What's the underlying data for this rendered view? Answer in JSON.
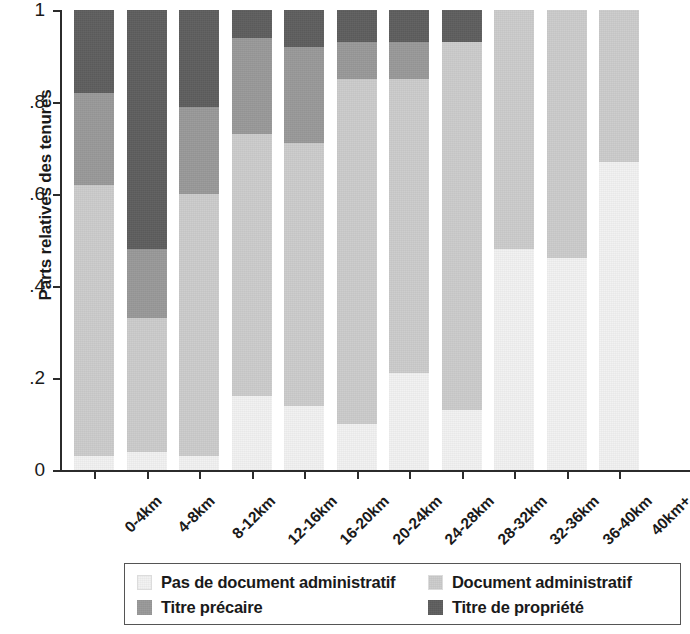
{
  "chart_data": {
    "type": "bar",
    "subtype": "stacked-100-percent",
    "title": "",
    "xlabel": "",
    "ylabel": "Parts relatives des tenures",
    "ylim": [
      0,
      1
    ],
    "ytick_labels": [
      "0",
      ".2",
      ".4",
      ".6",
      ".8",
      "1"
    ],
    "ytick_values": [
      0,
      0.2,
      0.4,
      0.6,
      0.8,
      1
    ],
    "grid": false,
    "legend_position": "bottom",
    "categories": [
      "0-4km",
      "4-8km",
      "8-12km",
      "12-16km",
      "16-20km",
      "20-24km",
      "24-28km",
      "28-32km",
      "32-36km",
      "36-40km",
      "40km+"
    ],
    "series": [
      {
        "name": "Pas de document administratif",
        "color": "#f2f2f2",
        "values": [
          0.03,
          0.04,
          0.03,
          0.16,
          0.14,
          0.1,
          0.21,
          0.13,
          0.48,
          0.46,
          0.67
        ]
      },
      {
        "name": "Document administratif",
        "color": "#cccccc",
        "values": [
          0.59,
          0.29,
          0.57,
          0.57,
          0.57,
          0.75,
          0.64,
          0.8,
          0.52,
          0.54,
          0.33
        ]
      },
      {
        "name": "Titre précaire",
        "color": "#999999",
        "values": [
          0.2,
          0.15,
          0.19,
          0.21,
          0.21,
          0.08,
          0.08,
          0.0,
          0.0,
          0.0,
          0.0
        ]
      },
      {
        "name": "Titre de propriété",
        "color": "#5e5e5e",
        "values": [
          0.18,
          0.52,
          0.21,
          0.06,
          0.08,
          0.07,
          0.07,
          0.07,
          0.0,
          0.0,
          0.0
        ]
      }
    ],
    "cumulative_tops": [
      [
        0.03,
        0.62,
        0.82,
        1.0
      ],
      [
        0.04,
        0.33,
        0.48,
        1.0
      ],
      [
        0.03,
        0.6,
        0.79,
        1.0
      ],
      [
        0.16,
        0.73,
        0.94,
        1.0
      ],
      [
        0.14,
        0.71,
        0.92,
        1.0
      ],
      [
        0.1,
        0.85,
        0.93,
        1.0
      ],
      [
        0.21,
        0.85,
        0.93,
        1.0
      ],
      [
        0.13,
        0.93,
        0.93,
        1.0
      ],
      [
        0.48,
        1.0,
        1.0,
        1.0
      ],
      [
        0.46,
        1.0,
        1.0,
        1.0
      ],
      [
        0.67,
        1.0,
        1.0,
        1.0
      ]
    ]
  },
  "legend": {
    "entries": [
      {
        "label": "Pas de document administratif",
        "color": "#f2f2f2"
      },
      {
        "label": "Document administratif",
        "color": "#cccccc"
      },
      {
        "label": "Titre précaire",
        "color": "#999999"
      },
      {
        "label": "Titre de propriété",
        "color": "#5e5e5e"
      }
    ]
  }
}
